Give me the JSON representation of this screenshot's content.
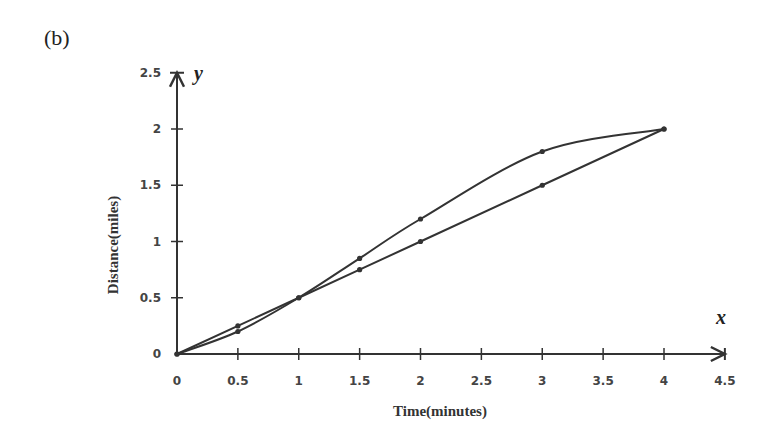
{
  "panel_label": "(b)",
  "chart_data": {
    "type": "line",
    "title": "",
    "xlabel": "Time(minutes)",
    "ylabel": "Distance(miles)",
    "x_axis_var": "x",
    "y_axis_var": "y",
    "xlim": [
      0,
      4.5
    ],
    "ylim": [
      0,
      2.5
    ],
    "xticks": [
      "0",
      "0.5",
      "1",
      "1.5",
      "2",
      "2.5",
      "3",
      "3.5",
      "4",
      "4.5"
    ],
    "yticks": [
      "0",
      "0.5",
      "1",
      "1.5",
      "2",
      "2.5"
    ],
    "grid": false,
    "legend": null,
    "series": [
      {
        "name": "straight line",
        "style": "linear",
        "points": [
          [
            0,
            0
          ],
          [
            0.5,
            0.25
          ],
          [
            1,
            0.5
          ],
          [
            1.5,
            0.75
          ],
          [
            2,
            1.0
          ],
          [
            3,
            1.5
          ],
          [
            4,
            2.0
          ]
        ]
      },
      {
        "name": "curve",
        "style": "smooth",
        "points": [
          [
            0,
            0
          ],
          [
            0.5,
            0.2
          ],
          [
            1,
            0.5
          ],
          [
            1.5,
            0.85
          ],
          [
            2,
            1.2
          ],
          [
            3,
            1.8
          ],
          [
            4,
            2.0
          ]
        ]
      }
    ]
  },
  "colors": {
    "line": "#333333",
    "axis": "#333333",
    "text": "#444444"
  }
}
